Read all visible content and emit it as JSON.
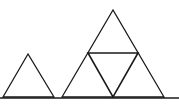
{
  "diagram": {
    "colors": {
      "background": "#ffffff",
      "stroke": "#1a1a1a",
      "baseline": "#555555"
    },
    "baseline": {
      "x1": 0,
      "y1": 98,
      "x2": 179,
      "y2": 98
    },
    "small_triangle": {
      "points": "28,54 3,97 54,97"
    },
    "large_triangle": {
      "points": "113,10 62,97 164,97"
    },
    "medial_triangle": {
      "points": "88,53 138,53 113,97"
    }
  }
}
